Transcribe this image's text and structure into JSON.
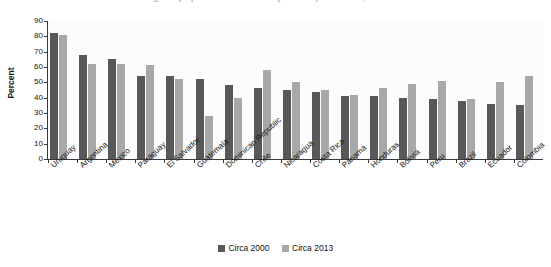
{
  "title_clipped": "Percentage of population covered by social protection, circa 2000 and 2013",
  "axis": {
    "ylabel": "Percent",
    "yticks": [
      "0",
      "10",
      "20",
      "30",
      "40",
      "50",
      "60",
      "70",
      "80",
      "90"
    ]
  },
  "legend": {
    "items": [
      {
        "label": "Circa 2000",
        "color": "#585858"
      },
      {
        "label": "Circa 2013",
        "color": "#a8a8a8"
      }
    ]
  },
  "chart_data": {
    "type": "bar",
    "title": "Percentage of population covered by social protection, circa 2000 and 2013",
    "xlabel": "",
    "ylabel": "Percent",
    "ylim": [
      0,
      90
    ],
    "ytick_step": 10,
    "grid": false,
    "legend_position": "bottom",
    "categories": [
      "Uruguay",
      "Argentina",
      "Mexico",
      "Paraguay",
      "El Salvador",
      "Guatemala",
      "Dominican Republic",
      "Chile",
      "Nicaragua",
      "Costa Rica",
      "Panama",
      "Honduras",
      "Bolivia",
      "Peru",
      "Brazil",
      "Ecuador",
      "Colombia"
    ],
    "series": [
      {
        "name": "Circa 2000",
        "color": "#585858",
        "values": [
          82,
          68,
          65,
          54,
          54,
          52,
          48,
          46,
          45,
          44,
          41,
          41,
          40,
          39,
          38,
          36,
          35
        ]
      },
      {
        "name": "Circa 2013",
        "color": "#a8a8a8",
        "values": [
          81,
          62,
          62,
          61,
          52,
          28,
          40,
          58,
          50,
          45,
          42,
          46,
          49,
          51,
          39,
          50,
          54
        ]
      }
    ]
  }
}
